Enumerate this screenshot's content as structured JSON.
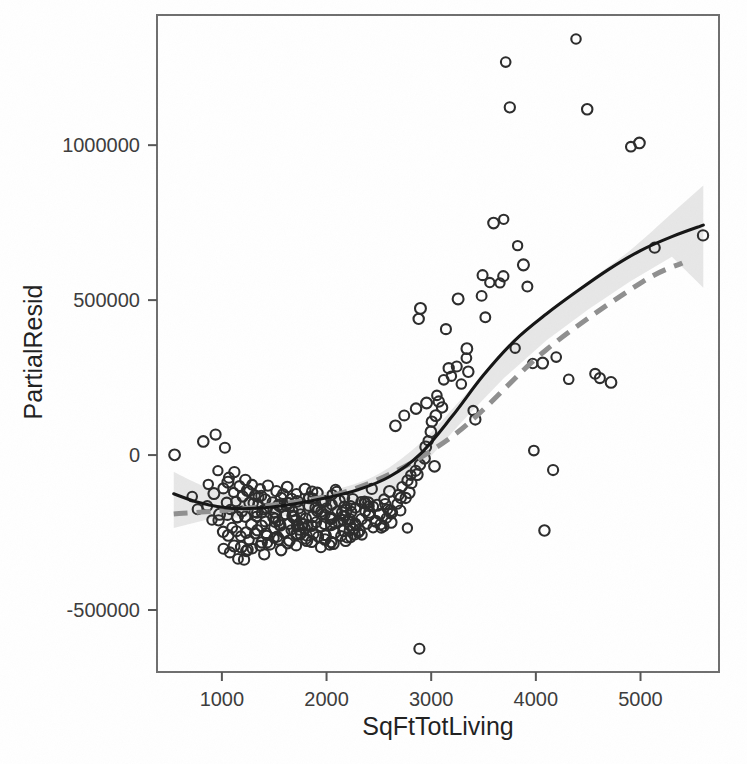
{
  "figure": {
    "background_color": "#ffffff",
    "frame_color": "#6e6e6e",
    "point_color": "#2b2b2b",
    "curve_color": "#141414",
    "dashed_color": "#8f8f8f",
    "band_color": "#d8d8d8"
  },
  "chart_data": {
    "type": "scatter",
    "title": "",
    "subtitle": "",
    "xlabel": "SqFtTotLiving",
    "ylabel": "PartialResid",
    "xlim": [
      380,
      5750
    ],
    "ylim": [
      -700000,
      1420000
    ],
    "grid": false,
    "legend_position": "none",
    "xticks": [
      1000,
      2000,
      3000,
      4000,
      5000
    ],
    "xtick_labels": [
      "1000",
      "2000",
      "3000",
      "4000",
      "5000"
    ],
    "yticks": [
      -500000,
      0,
      500000,
      1000000
    ],
    "ytick_labels": [
      "-500000",
      "0",
      "500000",
      "1000000"
    ],
    "annotations": [],
    "series": [
      {
        "name": "observations",
        "marker": "open-circle",
        "x": [
          540,
          700,
          760,
          820,
          860,
          880,
          900,
          930,
          950,
          960,
          980,
          990,
          1000,
          1010,
          1020,
          1030,
          1040,
          1050,
          1060,
          1070,
          1080,
          1090,
          1100,
          1110,
          1120,
          1130,
          1140,
          1150,
          1160,
          1170,
          1180,
          1190,
          1200,
          1210,
          1215,
          1220,
          1230,
          1240,
          1250,
          1260,
          1270,
          1280,
          1290,
          1300,
          1310,
          1320,
          1330,
          1340,
          1350,
          1360,
          1370,
          1380,
          1390,
          1400,
          1410,
          1420,
          1430,
          1440,
          1450,
          1460,
          1470,
          1480,
          1490,
          1500,
          1510,
          1520,
          1530,
          1540,
          1550,
          1560,
          1570,
          1580,
          1590,
          1600,
          1610,
          1620,
          1630,
          1640,
          1650,
          1660,
          1670,
          1680,
          1690,
          1700,
          1710,
          1720,
          1730,
          1740,
          1750,
          1760,
          1770,
          1780,
          1790,
          1800,
          1810,
          1820,
          1830,
          1840,
          1850,
          1860,
          1870,
          1880,
          1890,
          1900,
          1910,
          1920,
          1930,
          1940,
          1950,
          1960,
          1970,
          1980,
          1990,
          2000,
          2010,
          2020,
          2030,
          2040,
          2050,
          2060,
          2070,
          2080,
          2090,
          2100,
          2110,
          2120,
          2130,
          2140,
          2150,
          2160,
          2170,
          2180,
          2190,
          2200,
          2210,
          2220,
          2230,
          2240,
          2250,
          2260,
          2270,
          2280,
          2300,
          2320,
          2340,
          2360,
          2380,
          2400,
          2420,
          2440,
          2460,
          2480,
          2500,
          2520,
          2540,
          2560,
          2580,
          2600,
          2620,
          2640,
          2660,
          2680,
          2700,
          2720,
          2740,
          2760,
          2780,
          2800,
          2820,
          2840,
          2860,
          2880,
          2900,
          2920,
          2940,
          2960,
          2980,
          3000,
          3020,
          3050,
          3080,
          3100,
          3130,
          3160,
          3200,
          3240,
          3280,
          3320,
          3360,
          3400,
          3440,
          3480,
          3500,
          3520,
          3560,
          3600,
          3640,
          3680,
          3700,
          3720,
          3760,
          3800,
          3840,
          3880,
          3920,
          3960,
          4000,
          4050,
          4100,
          4150,
          4200,
          4300,
          4400,
          4500,
          4550,
          4600,
          4700,
          4900,
          5000,
          5150,
          5600,
          1150,
          1320,
          1480,
          1620,
          1780,
          1930,
          2080,
          2230,
          2380,
          1060,
          1240,
          1390,
          1540,
          1690,
          1840,
          1990,
          2140,
          2290,
          2440,
          1130,
          1290,
          1450,
          1600,
          1750,
          1900,
          2050,
          2200,
          2350,
          2500,
          1200,
          1360,
          1520,
          1670,
          1820,
          1970,
          2120,
          2270,
          2420,
          2570,
          1270,
          1430,
          1580,
          1730,
          1880,
          2030,
          2180,
          2330,
          2480,
          2630,
          1340,
          1500,
          1650,
          1800,
          1950,
          2100,
          2250,
          2400,
          2550,
          2700,
          1410,
          1570,
          1720,
          1870,
          2020,
          2170,
          2320,
          2470,
          2620,
          2770,
          2850,
          2950,
          3050,
          2750,
          2650,
          2900,
          2880,
          3150,
          3250,
          3350
        ],
        "y": [
          5000,
          -140000,
          -175000,
          45000,
          -95000,
          -160000,
          -210000,
          -130000,
          70000,
          -215000,
          -55000,
          -185000,
          -245000,
          -110000,
          -300000,
          -150000,
          30000,
          -195000,
          -260000,
          -85000,
          -170000,
          -320000,
          -125000,
          -230000,
          -60000,
          -290000,
          -155000,
          -335000,
          -200000,
          -105000,
          -265000,
          -180000,
          -335000,
          -140000,
          -85000,
          -245000,
          -310000,
          -195000,
          -120000,
          -275000,
          -160000,
          -230000,
          -95000,
          -305000,
          -185000,
          -250000,
          -130000,
          -200000,
          -290000,
          -165000,
          -235000,
          -110000,
          -275000,
          -190000,
          -315000,
          -145000,
          -220000,
          -260000,
          -175000,
          -100000,
          -295000,
          -205000,
          -150000,
          -240000,
          -180000,
          -120000,
          -270000,
          -215000,
          -310000,
          -165000,
          -230000,
          -135000,
          -250000,
          -195000,
          -285000,
          -160000,
          -225000,
          -105000,
          -275000,
          -190000,
          -145000,
          -240000,
          -210000,
          -130000,
          -260000,
          -175000,
          -295000,
          -150000,
          -220000,
          -185000,
          -255000,
          -115000,
          -240000,
          -200000,
          -270000,
          -160000,
          -225000,
          -140000,
          -285000,
          -195000,
          -230000,
          -170000,
          -250000,
          -125000,
          -210000,
          -265000,
          -180000,
          -300000,
          -155000,
          -235000,
          -190000,
          -270000,
          -145000,
          -215000,
          -255000,
          -175000,
          -230000,
          -130000,
          -290000,
          -200000,
          -165000,
          -245000,
          -120000,
          -225000,
          -185000,
          -265000,
          -150000,
          -210000,
          -240000,
          -170000,
          -280000,
          -195000,
          -135000,
          -250000,
          -215000,
          -160000,
          -230000,
          -190000,
          -265000,
          -145000,
          -225000,
          -175000,
          -240000,
          -205000,
          -260000,
          -180000,
          -150000,
          -220000,
          -195000,
          -240000,
          -165000,
          -210000,
          -185000,
          -230000,
          -145000,
          -200000,
          -175000,
          -215000,
          -120000,
          -190000,
          -155000,
          -135000,
          -175000,
          -100000,
          -145000,
          -80000,
          -115000,
          -60000,
          -90000,
          -45000,
          -65000,
          -25000,
          -630000,
          -15000,
          20000,
          40000,
          75000,
          110000,
          -30000,
          130000,
          170000,
          150000,
          245000,
          275000,
          250000,
          290000,
          230000,
          310000,
          270000,
          150000,
          120000,
          520000,
          580000,
          440000,
          560000,
          745000,
          560000,
          755000,
          580000,
          1270000,
          1120000,
          340000,
          680000,
          620000,
          550000,
          290000,
          20000,
          300000,
          -245000,
          -55000,
          320000,
          240000,
          1345000,
          1110000,
          260000,
          255000,
          240000,
          1000000,
          1005000,
          670000,
          705000,
          -245000,
          -185000,
          -265000,
          -150000,
          -220000,
          -175000,
          -290000,
          -200000,
          -160000,
          -75000,
          -310000,
          -130000,
          -265000,
          -195000,
          -140000,
          -255000,
          -180000,
          -230000,
          -110000,
          -200000,
          -160000,
          -285000,
          -120000,
          -240000,
          -175000,
          -205000,
          -265000,
          -150000,
          -230000,
          -295000,
          -135000,
          -220000,
          -185000,
          -270000,
          -145000,
          -210000,
          -250000,
          -190000,
          -165000,
          -115000,
          -255000,
          -170000,
          -230000,
          -125000,
          -280000,
          -195000,
          -145000,
          -215000,
          -180000,
          -240000,
          -200000,
          -155000,
          -265000,
          -190000,
          -110000,
          -235000,
          -170000,
          -225000,
          -135000,
          -175000,
          -220000,
          -260000,
          -140000,
          -205000,
          -185000,
          -250000,
          -165000,
          -195000,
          -230000,
          155000,
          165000,
          195000,
          125000,
          90000,
          470000,
          440000,
          410000,
          510000,
          345000
        ]
      },
      {
        "name": "loess-smooth",
        "style": "solid",
        "color": "#141414",
        "x": [
          540,
          800,
          1100,
          1400,
          1700,
          2000,
          2300,
          2600,
          2900,
          3200,
          3500,
          3800,
          4100,
          4400,
          4700,
          5000,
          5300,
          5600
        ],
        "y": [
          -125000,
          -155000,
          -172000,
          -170000,
          -157000,
          -138000,
          -112000,
          -70000,
          5000,
          125000,
          258000,
          370000,
          455000,
          530000,
          600000,
          660000,
          705000,
          742000
        ]
      },
      {
        "name": "linear-fit-dashed",
        "style": "dashed",
        "color": "#8f8f8f",
        "x": [
          540,
          1400,
          2300,
          3200,
          4100,
          5000,
          5400
        ],
        "y": [
          -190000,
          -165000,
          -105000,
          60000,
          340000,
          555000,
          620000
        ]
      }
    ],
    "confidence_band": {
      "name": "smooth-confidence-interval",
      "color": "#d8d8d8",
      "x": [
        540,
        900,
        1300,
        1700,
        2100,
        2500,
        2900,
        3300,
        3700,
        4100,
        4500,
        4900,
        5300,
        5600
      ],
      "upper": [
        -55000,
        -110000,
        -140000,
        -135000,
        -110000,
        -60000,
        40000,
        185000,
        330000,
        450000,
        560000,
        660000,
        780000,
        870000
      ],
      "lower": [
        -235000,
        -205000,
        -200000,
        -195000,
        -180000,
        -148000,
        -40000,
        110000,
        250000,
        370000,
        470000,
        560000,
        640000,
        540000
      ]
    }
  },
  "axes": {
    "x_axis": {
      "label": "SqFtTotLiving",
      "ticks": [
        {
          "value": 1000,
          "label": "1000"
        },
        {
          "value": 2000,
          "label": "2000"
        },
        {
          "value": 3000,
          "label": "3000"
        },
        {
          "value": 4000,
          "label": "4000"
        },
        {
          "value": 5000,
          "label": "5000"
        }
      ]
    },
    "y_axis": {
      "label": "PartialResid",
      "ticks": [
        {
          "value": 1000000,
          "label": "1000000"
        },
        {
          "value": 500000,
          "label": "500000"
        },
        {
          "value": 0,
          "label": "0"
        },
        {
          "value": -500000,
          "label": "-500000"
        }
      ]
    }
  }
}
